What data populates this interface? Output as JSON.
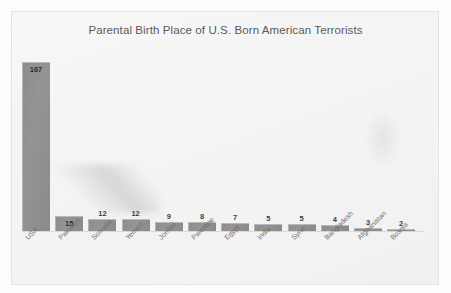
{
  "chart_data": {
    "type": "bar",
    "title": "Parental Birth Place of U.S. Born American Terrorists",
    "xlabel": "",
    "ylabel": "",
    "ylim": [
      0,
      175
    ],
    "grid": false,
    "legend": "none",
    "orientation": "vertical",
    "bar_color": "#8d8d8d",
    "background_color": "#f4f4f4",
    "label_rotation_deg": -45,
    "categories": [
      "USA",
      "Pakistan",
      "Somalia",
      "Yemen",
      "Jordan",
      "Palestine",
      "Egypt",
      "India",
      "Syria",
      "Bangladesh",
      "Afghanistan",
      "Bosnia"
    ],
    "values": [
      167,
      15,
      12,
      12,
      9,
      8,
      7,
      5,
      5,
      4,
      3,
      2
    ],
    "data_labels": [
      "167",
      "15",
      "12",
      "12",
      "9",
      "8",
      "7",
      "5",
      "5",
      "4",
      "3",
      "2"
    ]
  }
}
